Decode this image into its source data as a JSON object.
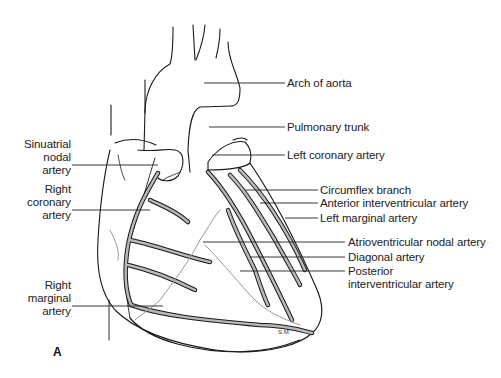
{
  "figure": {
    "panel_label": "A",
    "signature": "S.M.",
    "labels_left": [
      {
        "id": "sinuatrial",
        "lines": [
          "Sinuatrial",
          "nodal",
          "artery"
        ]
      },
      {
        "id": "right-coronary",
        "lines": [
          "Right",
          "coronary",
          "artery"
        ]
      },
      {
        "id": "right-marginal",
        "lines": [
          "Right",
          "marginal",
          "artery"
        ]
      }
    ],
    "labels_right": [
      {
        "id": "arch-of-aorta",
        "text": "Arch of aorta"
      },
      {
        "id": "pulmonary-trunk",
        "text": "Pulmonary trunk"
      },
      {
        "id": "left-coronary",
        "text": "Left coronary artery"
      },
      {
        "id": "circumflex",
        "text": "Circumflex branch"
      },
      {
        "id": "anterior-interventricular",
        "text": "Anterior interventricular artery"
      },
      {
        "id": "left-marginal",
        "text": "Left marginal artery"
      },
      {
        "id": "av-nodal",
        "text": "Atrioventricular nodal artery"
      },
      {
        "id": "diagonal",
        "text": "Diagonal artery"
      },
      {
        "id": "posterior-interventricular",
        "lines": [
          "Posterior",
          "interventricular artery"
        ]
      }
    ]
  }
}
